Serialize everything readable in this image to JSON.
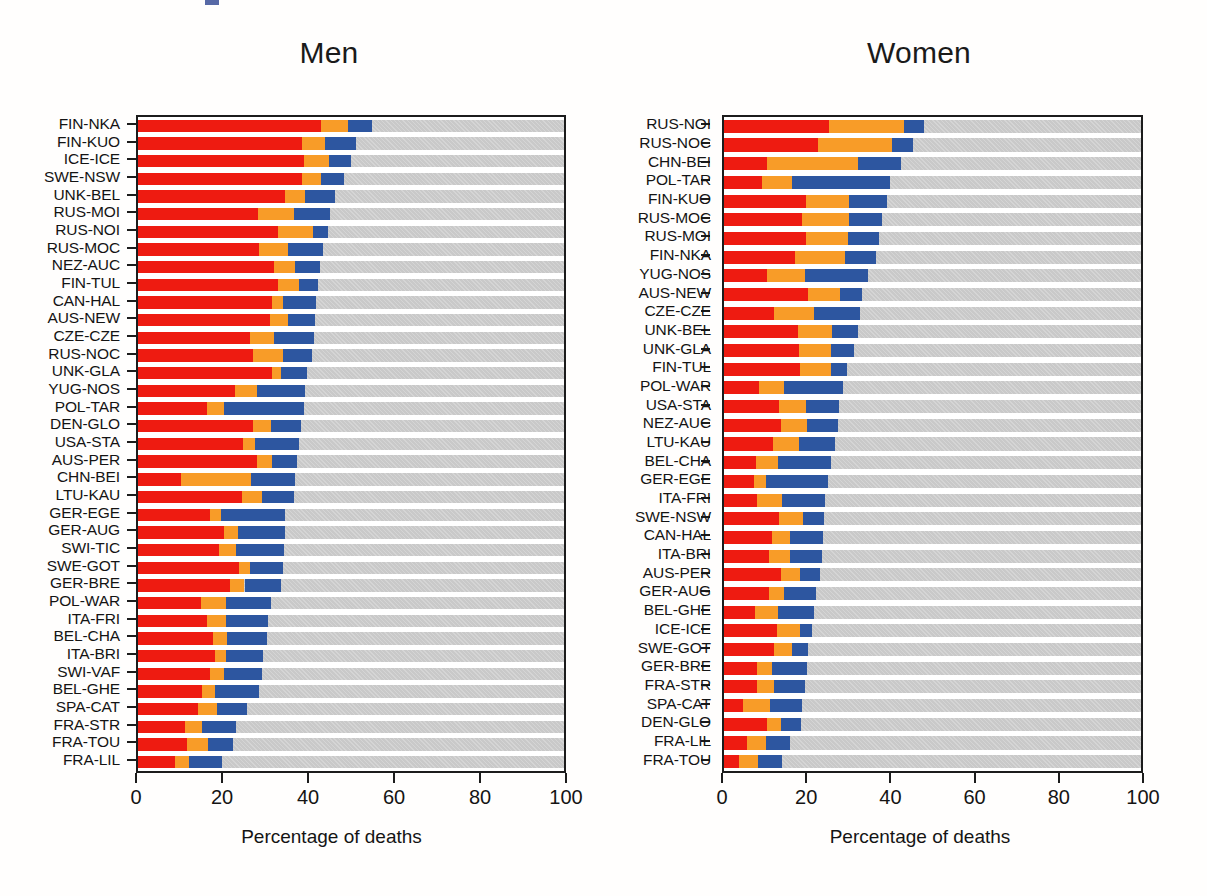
{
  "figure": {
    "xlabel": "Percentage of deaths",
    "xticks": [
      0,
      20,
      40,
      60,
      80,
      100
    ],
    "colors": {
      "series1": "#ee1b11",
      "series2": "#f89c28",
      "series3": "#2d56a0",
      "remainder": "#c9c9c9",
      "axis": "#1c1c1c",
      "text": "#141414"
    }
  },
  "chart_data": [
    {
      "type": "bar",
      "orientation": "horizontal",
      "stacked": true,
      "title": "Men",
      "xlabel": "Percentage of deaths",
      "ylabel": "",
      "xlim": [
        0,
        100
      ],
      "grid": false,
      "legend": "none",
      "series": [
        {
          "name": "segment-1",
          "color": "#ee1b11"
        },
        {
          "name": "segment-2",
          "color": "#f89c28"
        },
        {
          "name": "segment-3",
          "color": "#2d56a0"
        },
        {
          "name": "remainder",
          "color": "#c9c9c9"
        }
      ],
      "categories": [
        "FIN-NKA",
        "FIN-KUO",
        "ICE-ICE",
        "SWE-NSW",
        "UNK-BEL",
        "RUS-MOI",
        "RUS-NOI",
        "RUS-MOC",
        "NEZ-AUC",
        "FIN-TUL",
        "CAN-HAL",
        "AUS-NEW",
        "CZE-CZE",
        "RUS-NOC",
        "UNK-GLA",
        "YUG-NOS",
        "POL-TAR",
        "DEN-GLO",
        "USA-STA",
        "AUS-PER",
        "CHN-BEI",
        "LTU-KAU",
        "GER-EGE",
        "GER-AUG",
        "SWI-TIC",
        "SWE-GOT",
        "GER-BRE",
        "POL-WAR",
        "ITA-FRI",
        "BEL-CHA",
        "ITA-BRI",
        "SWI-VAF",
        "BEL-GHE",
        "SPA-CAT",
        "FRA-STR",
        "FRA-TOU",
        "FRA-LIL"
      ],
      "rows": [
        {
          "category": "FIN-NKA",
          "values": [
            42.9,
            6.5,
            5.6
          ],
          "total": 55.0
        },
        {
          "category": "FIN-KUO",
          "values": [
            38.4,
            5.5,
            7.2
          ],
          "total": 51.1
        },
        {
          "category": "ICE-ICE",
          "values": [
            39.0,
            5.8,
            5.1
          ],
          "total": 49.9
        },
        {
          "category": "SWE-NSW",
          "values": [
            38.5,
            4.4,
            5.4
          ],
          "total": 48.3
        },
        {
          "category": "UNK-BEL",
          "values": [
            34.6,
            4.6,
            7.0
          ],
          "total": 46.2
        },
        {
          "category": "RUS-MOI",
          "values": [
            28.2,
            8.5,
            8.4
          ],
          "total": 45.1
        },
        {
          "category": "RUS-NOI",
          "values": [
            32.8,
            8.2,
            3.6
          ],
          "total": 44.6
        },
        {
          "category": "RUS-MOC",
          "values": [
            28.5,
            6.7,
            8.2
          ],
          "total": 43.4
        },
        {
          "category": "NEZ-AUC",
          "values": [
            32.0,
            4.8,
            6.0
          ],
          "total": 42.8
        },
        {
          "category": "FIN-TUL",
          "values": [
            32.8,
            5.0,
            4.5
          ],
          "total": 42.3
        },
        {
          "category": "CAN-HAL",
          "values": [
            31.4,
            2.6,
            7.9
          ],
          "total": 41.9
        },
        {
          "category": "AUS-NEW",
          "values": [
            31.0,
            4.2,
            6.3
          ],
          "total": 41.5
        },
        {
          "category": "CZE-CZE",
          "values": [
            26.4,
            5.5,
            9.4
          ],
          "total": 41.3
        },
        {
          "category": "RUS-NOC",
          "values": [
            27.0,
            7.0,
            6.9
          ],
          "total": 40.9
        },
        {
          "category": "UNK-GLA",
          "values": [
            31.4,
            2.2,
            6.1
          ],
          "total": 39.7
        },
        {
          "category": "YUG-NOS",
          "values": [
            22.8,
            5.2,
            11.3
          ],
          "total": 39.3
        },
        {
          "category": "POL-TAR",
          "values": [
            16.3,
            3.9,
            18.8
          ],
          "total": 39.0
        },
        {
          "category": "DEN-GLO",
          "values": [
            26.9,
            4.4,
            6.9
          ],
          "total": 38.2
        },
        {
          "category": "USA-STA",
          "values": [
            24.6,
            2.9,
            10.3
          ],
          "total": 37.8
        },
        {
          "category": "AUS-PER",
          "values": [
            27.9,
            3.5,
            5.9
          ],
          "total": 37.3
        },
        {
          "category": "CHN-BEI",
          "values": [
            10.2,
            16.4,
            10.3
          ],
          "total": 36.9
        },
        {
          "category": "LTU-KAU",
          "values": [
            24.4,
            4.6,
            7.6
          ],
          "total": 36.6
        },
        {
          "category": "GER-EGE",
          "values": [
            16.9,
            2.5,
            15.1
          ],
          "total": 34.5
        },
        {
          "category": "GER-AUG",
          "values": [
            20.3,
            3.2,
            10.9
          ],
          "total": 34.4
        },
        {
          "category": "SWI-TIC",
          "values": [
            19.0,
            4.0,
            11.2
          ],
          "total": 34.2
        },
        {
          "category": "SWE-GOT",
          "values": [
            23.6,
            2.8,
            7.6
          ],
          "total": 34.0
        },
        {
          "category": "GER-BRE",
          "values": [
            21.6,
            3.4,
            8.6
          ],
          "total": 33.6
        },
        {
          "category": "POL-WAR",
          "values": [
            14.8,
            5.8,
            10.6
          ],
          "total": 31.2
        },
        {
          "category": "ITA-FRI",
          "values": [
            16.2,
            4.4,
            10.0
          ],
          "total": 30.6
        },
        {
          "category": "BEL-CHA",
          "values": [
            17.6,
            3.3,
            9.4
          ],
          "total": 30.3
        },
        {
          "category": "ITA-BRI",
          "values": [
            18.0,
            2.6,
            8.8
          ],
          "total": 29.4
        },
        {
          "category": "SWI-VAF",
          "values": [
            16.8,
            3.4,
            9.0
          ],
          "total": 29.2
        },
        {
          "category": "BEL-GHE",
          "values": [
            15.1,
            3.0,
            10.4
          ],
          "total": 28.5
        },
        {
          "category": "SPA-CAT",
          "values": [
            14.2,
            4.4,
            7.0
          ],
          "total": 25.6
        },
        {
          "category": "FRA-STR",
          "values": [
            11.0,
            4.0,
            8.0
          ],
          "total": 23.0
        },
        {
          "category": "FRA-TOU",
          "values": [
            11.4,
            5.0,
            6.0
          ],
          "total": 22.4
        },
        {
          "category": "FRA-LIL",
          "values": [
            8.6,
            3.4,
            7.8
          ],
          "total": 19.8
        }
      ]
    },
    {
      "type": "bar",
      "orientation": "horizontal",
      "stacked": true,
      "title": "Women",
      "xlabel": "Percentage of deaths",
      "ylabel": "",
      "xlim": [
        0,
        100
      ],
      "grid": false,
      "legend": "none",
      "series": [
        {
          "name": "segment-1",
          "color": "#ee1b11"
        },
        {
          "name": "segment-2",
          "color": "#f89c28"
        },
        {
          "name": "segment-3",
          "color": "#2d56a0"
        },
        {
          "name": "remainder",
          "color": "#c9c9c9"
        }
      ],
      "categories": [
        "RUS-NOI",
        "RUS-NOC",
        "CHN-BEI",
        "POL-TAR",
        "FIN-KUO",
        "RUS-MOC",
        "RUS-MOI",
        "FIN-NKA",
        "YUG-NOS",
        "AUS-NEW",
        "CZE-CZE",
        "UNK-BEL",
        "UNK-GLA",
        "FIN-TUL",
        "POL-WAR",
        "USA-STA",
        "NEZ-AUC",
        "LTU-KAU",
        "BEL-CHA",
        "GER-EGE",
        "ITA-FRI",
        "SWE-NSW",
        "CAN-HAL",
        "ITA-BRI",
        "AUS-PER",
        "GER-AUG",
        "BEL-GHE",
        "ICE-ICE",
        "SWE-GOT",
        "GER-BRE",
        "FRA-STR",
        "SPA-CAT",
        "DEN-GLO",
        "FRA-LIL",
        "FRA-TOU"
      ],
      "rows": [
        {
          "category": "RUS-NOI",
          "values": [
            25.2,
            17.9,
            4.8
          ],
          "total": 47.9
        },
        {
          "category": "RUS-NOC",
          "values": [
            22.6,
            17.6,
            5.2
          ],
          "total": 45.4
        },
        {
          "category": "CHN-BEI",
          "values": [
            10.2,
            21.9,
            10.4
          ],
          "total": 42.5
        },
        {
          "category": "POL-TAR",
          "values": [
            9.0,
            7.4,
            23.4
          ],
          "total": 39.8
        },
        {
          "category": "FIN-KUO",
          "values": [
            19.7,
            10.2,
            9.3
          ],
          "total": 39.2
        },
        {
          "category": "RUS-MOC",
          "values": [
            18.6,
            11.4,
            7.8
          ],
          "total": 37.8
        },
        {
          "category": "RUS-MOI",
          "values": [
            19.7,
            10.1,
            7.4
          ],
          "total": 37.2
        },
        {
          "category": "FIN-NKA",
          "values": [
            17.1,
            11.8,
            7.5
          ],
          "total": 36.4
        },
        {
          "category": "YUG-NOS",
          "values": [
            10.3,
            9.1,
            15.1
          ],
          "total": 34.5
        },
        {
          "category": "AUS-NEW",
          "values": [
            20.2,
            7.6,
            5.4
          ],
          "total": 33.2
        },
        {
          "category": "CZE-CZE",
          "values": [
            12.0,
            9.6,
            10.9
          ],
          "total": 32.5
        },
        {
          "category": "UNK-BEL",
          "values": [
            17.8,
            8.2,
            6.2
          ],
          "total": 32.2
        },
        {
          "category": "UNK-GLA",
          "values": [
            18.1,
            7.5,
            5.6
          ],
          "total": 31.2
        },
        {
          "category": "FIN-TUL",
          "values": [
            18.2,
            7.5,
            3.9
          ],
          "total": 29.6
        },
        {
          "category": "POL-WAR",
          "values": [
            8.5,
            6.0,
            14.0
          ],
          "total": 28.5
        },
        {
          "category": "USA-STA",
          "values": [
            13.1,
            6.5,
            8.1
          ],
          "total": 27.7
        },
        {
          "category": "NEZ-AUC",
          "values": [
            13.6,
            6.3,
            7.4
          ],
          "total": 27.3
        },
        {
          "category": "LTU-KAU",
          "values": [
            11.7,
            6.2,
            8.8
          ],
          "total": 26.7
        },
        {
          "category": "BEL-CHA",
          "values": [
            7.6,
            5.4,
            12.7
          ],
          "total": 25.7
        },
        {
          "category": "GER-EGE",
          "values": [
            7.2,
            2.8,
            14.9
          ],
          "total": 24.9
        },
        {
          "category": "ITA-FRI",
          "values": [
            8.0,
            5.8,
            10.4
          ],
          "total": 24.2
        },
        {
          "category": "SWE-NSW",
          "values": [
            13.2,
            5.8,
            5.0
          ],
          "total": 24.0
        },
        {
          "category": "CAN-HAL",
          "values": [
            11.4,
            4.4,
            7.9
          ],
          "total": 23.7
        },
        {
          "category": "ITA-BRI",
          "values": [
            10.8,
            5.0,
            7.6
          ],
          "total": 23.4
        },
        {
          "category": "AUS-PER",
          "values": [
            13.6,
            4.6,
            4.8
          ],
          "total": 23.0
        },
        {
          "category": "GER-AUG",
          "values": [
            10.8,
            3.5,
            7.8
          ],
          "total": 22.1
        },
        {
          "category": "BEL-GHE",
          "values": [
            7.4,
            5.6,
            8.6
          ],
          "total": 21.6
        },
        {
          "category": "ICE-ICE",
          "values": [
            12.6,
            5.7,
            2.7
          ],
          "total": 21.0
        },
        {
          "category": "SWE-GOT",
          "values": [
            12.0,
            4.2,
            4.0
          ],
          "total": 20.2
        },
        {
          "category": "GER-BRE",
          "values": [
            7.8,
            3.6,
            8.4
          ],
          "total": 19.8
        },
        {
          "category": "FRA-STR",
          "values": [
            7.8,
            4.2,
            7.4
          ],
          "total": 19.4
        },
        {
          "category": "SPA-CAT",
          "values": [
            4.6,
            6.4,
            7.6
          ],
          "total": 18.6
        },
        {
          "category": "DEN-GLO",
          "values": [
            10.4,
            3.2,
            4.8
          ],
          "total": 18.4
        },
        {
          "category": "FRA-LIL",
          "values": [
            5.6,
            4.4,
            5.8
          ],
          "total": 15.8
        },
        {
          "category": "FRA-TOU",
          "values": [
            3.6,
            4.6,
            5.6
          ],
          "total": 13.8
        }
      ]
    }
  ]
}
